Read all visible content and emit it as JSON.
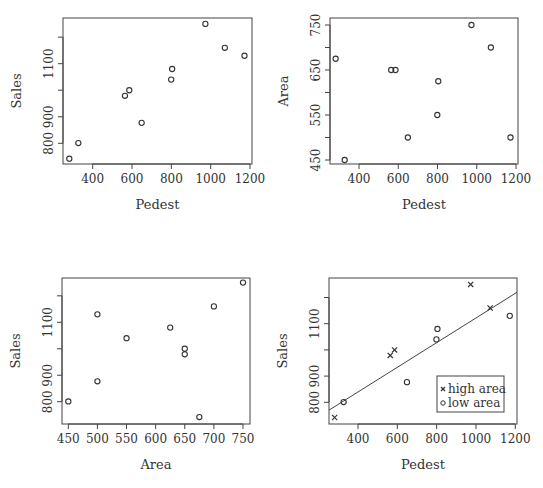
{
  "chart_data": [
    {
      "type": "scatter",
      "panel": "top-left",
      "xlabel": "Pedest",
      "ylabel": "Sales",
      "xticks": [
        400,
        600,
        800,
        1000,
        1200
      ],
      "yticks": [
        800,
        900,
        1000,
        1100,
        1200
      ],
      "ytick_labels_shown": [
        "800",
        "900",
        "1100"
      ],
      "xlim": [
        250,
        1200
      ],
      "ylim": [
        720,
        1260
      ],
      "marker": "circle",
      "x": [
        281,
        327,
        564,
        586,
        649,
        799,
        804,
        973,
        1072,
        1172
      ],
      "y": [
        742,
        801,
        979,
        1000,
        877,
        1040,
        1080,
        1250,
        1160,
        1130
      ]
    },
    {
      "type": "scatter",
      "panel": "top-right",
      "xlabel": "Pedest",
      "ylabel": "Area",
      "xticks": [
        400,
        600,
        800,
        1000,
        1200
      ],
      "yticks": [
        450,
        500,
        550,
        600,
        650,
        700,
        750
      ],
      "ytick_labels_shown": [
        "450",
        "550",
        "650",
        "750"
      ],
      "xlim": [
        250,
        1200
      ],
      "ylim": [
        440,
        760
      ],
      "marker": "circle",
      "x": [
        281,
        327,
        564,
        586,
        649,
        799,
        804,
        973,
        1072,
        1172
      ],
      "y": [
        675,
        450,
        650,
        650,
        500,
        550,
        625,
        750,
        700,
        500
      ]
    },
    {
      "type": "scatter",
      "panel": "bottom-left",
      "xlabel": "Area",
      "ylabel": "Sales",
      "xticks": [
        450,
        500,
        550,
        600,
        650,
        700,
        750
      ],
      "yticks": [
        800,
        900,
        1000,
        1100,
        1200
      ],
      "ytick_labels_shown": [
        "800",
        "900",
        "1100"
      ],
      "xlim": [
        440,
        760
      ],
      "ylim": [
        720,
        1260
      ],
      "marker": "circle",
      "x": [
        675,
        450,
        650,
        650,
        500,
        550,
        625,
        750,
        700,
        500
      ],
      "y": [
        742,
        801,
        979,
        1000,
        877,
        1040,
        1080,
        1250,
        1160,
        1130
      ]
    },
    {
      "type": "scatter",
      "panel": "bottom-right",
      "xlabel": "Pedest",
      "ylabel": "Sales",
      "xticks": [
        400,
        600,
        800,
        1000,
        1200
      ],
      "yticks": [
        800,
        900,
        1000,
        1100,
        1200
      ],
      "ytick_labels_shown": [
        "800",
        "900",
        "1100"
      ],
      "xlim": [
        250,
        1200
      ],
      "ylim": [
        720,
        1260
      ],
      "legend": [
        "high area",
        "low area"
      ],
      "legend_position": "bottom-right",
      "series": [
        {
          "name": "high area",
          "marker": "x",
          "x": [
            281,
            564,
            586,
            973,
            1072
          ],
          "y": [
            742,
            979,
            1000,
            1250,
            1160
          ]
        },
        {
          "name": "low area",
          "marker": "circle",
          "x": [
            327,
            649,
            799,
            804,
            1172
          ],
          "y": [
            801,
            877,
            1040,
            1080,
            1130
          ]
        }
      ],
      "fit_line": {
        "x": [
          250,
          1200
        ],
        "y": [
          770,
          1220
        ]
      }
    }
  ],
  "panels": [
    {
      "xlabel": "Pedest",
      "ylabel": "Sales"
    },
    {
      "xlabel": "Pedest",
      "ylabel": "Area"
    },
    {
      "xlabel": "Area",
      "ylabel": "Sales"
    },
    {
      "xlabel": "Pedest",
      "ylabel": "Sales",
      "legend": {
        "high": "high area",
        "low": "low area"
      }
    }
  ]
}
